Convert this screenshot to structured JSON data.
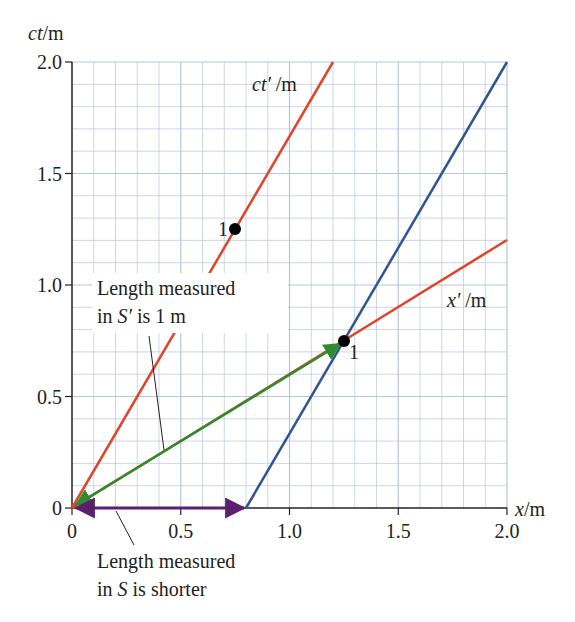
{
  "chart_data": {
    "type": "line",
    "title": "",
    "xlabel": "x/m",
    "ylabel": "ct/m",
    "xlim": [
      0,
      2.0
    ],
    "ylim": [
      0,
      2.0
    ],
    "grid": true,
    "grid_minor_step": 0.1,
    "grid_major_step": 0.5,
    "x_ticks": [
      "0",
      "0.5",
      "1.0",
      "1.5",
      "2.0"
    ],
    "y_ticks": [
      "0",
      "0.5",
      "1.0",
      "1.5",
      "2.0"
    ],
    "series": [
      {
        "name": "ct'/m axis",
        "color": "#e0452a",
        "points": [
          [
            0,
            0
          ],
          [
            1.2,
            2.0
          ]
        ]
      },
      {
        "name": "x'/m axis",
        "color": "#e0452a",
        "points": [
          [
            0,
            0
          ],
          [
            2.0,
            1.2
          ]
        ]
      },
      {
        "name": "worldline of rod end",
        "color": "#2f5597",
        "points": [
          [
            0.8,
            0
          ],
          [
            2.0,
            2.0
          ]
        ]
      },
      {
        "name": "length in S'",
        "color": "#2e8b2e",
        "type": "double-arrow",
        "points": [
          [
            0,
            0
          ],
          [
            1.25,
            0.75
          ]
        ]
      },
      {
        "name": "length in S",
        "color": "#5b1f6e",
        "type": "double-arrow",
        "points": [
          [
            0,
            0
          ],
          [
            0.8,
            0
          ]
        ]
      }
    ],
    "markers": [
      {
        "label": "1",
        "x": 0.75,
        "y": 1.25,
        "on": "ct' axis"
      },
      {
        "label": "1",
        "x": 1.25,
        "y": 0.75,
        "on": "x' axis"
      }
    ],
    "annotations": [
      {
        "text_line1": "Length measured",
        "text_line2": "in S′ is 1 m",
        "points_to": "green arrow"
      },
      {
        "text_line1": "Length measured",
        "text_line2": "in S is shorter",
        "points_to": "purple arrow"
      }
    ],
    "axis_labels": {
      "ct_prime": "ct′ /m",
      "x_prime": "x′ /m"
    }
  },
  "labels": {
    "y_axis_title": "ct/m",
    "x_axis_title": "x/m",
    "ct_prime": "ct′ /m",
    "x_prime": "x′ /m",
    "marker1": "1",
    "marker2": "1",
    "annot1_line1": "Length measured",
    "annot1_line2_a": "in ",
    "annot1_line2_S": "S′",
    "annot1_line2_b": " is 1 m",
    "annot2_line1": "Length measured",
    "annot2_line2_a": "in ",
    "annot2_line2_S": "S",
    "annot2_line2_b": " is shorter",
    "x_ticks": [
      "0",
      "0.5",
      "1.0",
      "1.5",
      "2.0"
    ],
    "y_ticks": [
      "0",
      "0.5",
      "1.0",
      "1.5",
      "2.0"
    ]
  },
  "colors": {
    "red": "#e0452a",
    "blue": "#2f5597",
    "green": "#2e8b2e",
    "purple": "#5b1f6e",
    "grid": "#b8c3e0",
    "axis": "#222222"
  }
}
